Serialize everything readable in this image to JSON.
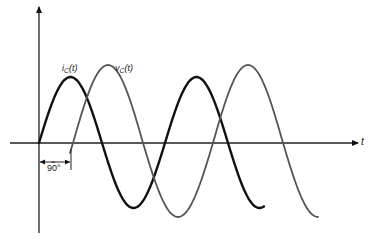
{
  "diagram": {
    "axes": {
      "origin": [
        39,
        143
      ],
      "y_axis": {
        "top": 5,
        "bottom": 233,
        "arrow": true
      },
      "x_axis": {
        "left": 10,
        "right": 358,
        "arrow": true,
        "label": "t"
      }
    },
    "series": [
      {
        "name": "i_C(t)",
        "label_main": "i",
        "label_sub": "C",
        "label_suffix": "(t)",
        "color": "#111111",
        "stroke_width": 2.4,
        "x_start": 39,
        "x_end": 264,
        "phase_x": 39,
        "period": 126,
        "amp_up": 66,
        "amp_down": 65
      },
      {
        "name": "v_C(t)",
        "label_main": "v",
        "label_sub": "C",
        "label_suffix": "(t)",
        "color": "#555555",
        "stroke_width": 1.8,
        "x_start": 70,
        "x_end": 318,
        "phase_x": 73,
        "period": 140,
        "amp_up": 78,
        "amp_down": 74
      }
    ],
    "phase_annotation": {
      "text": "90°",
      "x1": 39,
      "x2": 70,
      "y": 162
    }
  },
  "chart_data": {
    "type": "line",
    "title": "",
    "xlabel": "t",
    "ylabel": "",
    "series": [
      {
        "name": "i_C(t)",
        "description": "sinusoid starting at 0 rising; leads v_C(t) by 90°",
        "x": [
          0,
          90,
          180,
          270,
          360,
          450,
          540,
          630
        ],
        "values": [
          0,
          1,
          0,
          -1,
          0,
          1,
          0,
          -1
        ]
      },
      {
        "name": "v_C(t)",
        "description": "sinusoid lagging i_C(t) by 90°, larger amplitude",
        "x": [
          90,
          180,
          270,
          360,
          450,
          540,
          630,
          720
        ],
        "values": [
          0,
          1.2,
          0,
          -1.2,
          0,
          1.2,
          0,
          -1.2
        ]
      }
    ],
    "annotations": [
      "i_C(t)",
      "v_C(t)",
      "90°",
      "t"
    ],
    "phase_shift_deg": 90
  }
}
